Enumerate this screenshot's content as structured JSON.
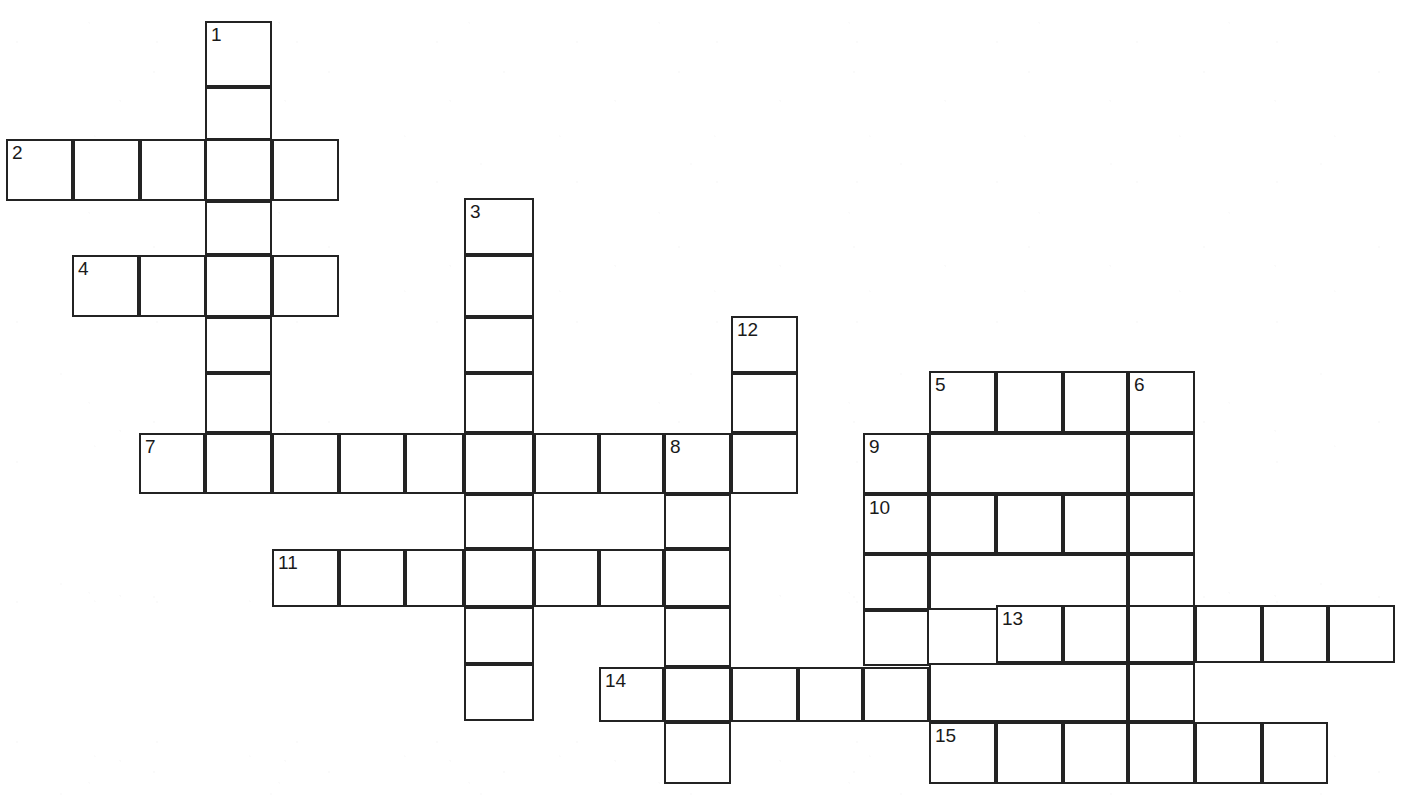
{
  "puzzle": {
    "kind": "crossword-grid",
    "title": "",
    "cell_size": 66.5,
    "border_color": "#232323",
    "cell_fill": "#ffffff",
    "page_background": "#ffffff",
    "number_color": "#1a1a1a",
    "clue_numbers": [
      "1",
      "2",
      "3",
      "4",
      "5",
      "6",
      "7",
      "8",
      "9",
      "10",
      "11",
      "12",
      "13",
      "14",
      "15"
    ],
    "entries": [
      {
        "number": "1",
        "direction": "down",
        "length": 7,
        "start_x": 206,
        "start_y": 22
      },
      {
        "number": "2",
        "direction": "across",
        "length": 5,
        "start_x": 7,
        "start_y": 140
      },
      {
        "number": "3",
        "direction": "down",
        "length": 8,
        "start_x": 465,
        "start_y": 199
      },
      {
        "number": "4",
        "direction": "across",
        "length": 4,
        "start_x": 73,
        "start_y": 256
      },
      {
        "number": "5",
        "direction": "down",
        "length": 6,
        "start_x": 930,
        "start_y": 372
      },
      {
        "number": "6",
        "direction": "down",
        "length": 6,
        "start_x": 1129,
        "start_y": 372
      },
      {
        "number": "7",
        "direction": "across",
        "length": 10,
        "start_x": 140,
        "start_y": 434
      },
      {
        "number": "8",
        "direction": "down",
        "length": 6,
        "start_x": 665,
        "start_y": 434
      },
      {
        "number": "9",
        "direction": "across",
        "length": 5,
        "start_x": 864,
        "start_y": 434
      },
      {
        "number": "9b",
        "direction": "down",
        "length": 6,
        "start_x": 864,
        "start_y": 434
      },
      {
        "number": "10",
        "direction": "across",
        "length": 5,
        "start_x": 864,
        "start_y": 495
      },
      {
        "number": "11",
        "direction": "across",
        "length": 7,
        "start_x": 273,
        "start_y": 550
      },
      {
        "number": "12",
        "direction": "down",
        "length": 3,
        "start_x": 732,
        "start_y": 317
      },
      {
        "number": "13",
        "direction": "across",
        "length": 6,
        "start_x": 997,
        "start_y": 606
      },
      {
        "number": "14",
        "direction": "across",
        "length": 5,
        "start_x": 600,
        "start_y": 668
      },
      {
        "number": "15",
        "direction": "across",
        "length": 6,
        "start_x": 930,
        "start_y": 723
      }
    ],
    "cells": [
      {
        "x": 206,
        "y": 22,
        "w": 67,
        "h": 66,
        "number": "1"
      },
      {
        "x": 206,
        "y": 88,
        "w": 67,
        "h": 53,
        "number": ""
      },
      {
        "x": 7,
        "y": 140,
        "w": 67,
        "h": 62,
        "number": "2"
      },
      {
        "x": 74,
        "y": 140,
        "w": 67,
        "h": 62,
        "number": ""
      },
      {
        "x": 141,
        "y": 140,
        "w": 66,
        "h": 62,
        "number": ""
      },
      {
        "x": 206,
        "y": 140,
        "w": 67,
        "h": 62,
        "number": ""
      },
      {
        "x": 273,
        "y": 140,
        "w": 67,
        "h": 62,
        "number": ""
      },
      {
        "x": 206,
        "y": 202,
        "w": 67,
        "h": 54,
        "number": ""
      },
      {
        "x": 465,
        "y": 199,
        "w": 70,
        "h": 57,
        "number": "3"
      },
      {
        "x": 73,
        "y": 256,
        "w": 67,
        "h": 62,
        "number": "4"
      },
      {
        "x": 140,
        "y": 256,
        "w": 67,
        "h": 62,
        "number": ""
      },
      {
        "x": 206,
        "y": 256,
        "w": 67,
        "h": 62,
        "number": ""
      },
      {
        "x": 273,
        "y": 256,
        "w": 67,
        "h": 62,
        "number": ""
      },
      {
        "x": 465,
        "y": 256,
        "w": 70,
        "h": 62,
        "number": ""
      },
      {
        "x": 206,
        "y": 318,
        "w": 67,
        "h": 56,
        "number": ""
      },
      {
        "x": 465,
        "y": 318,
        "w": 70,
        "h": 56,
        "number": ""
      },
      {
        "x": 732,
        "y": 317,
        "w": 67,
        "h": 57,
        "number": "12"
      },
      {
        "x": 206,
        "y": 374,
        "w": 67,
        "h": 60,
        "number": ""
      },
      {
        "x": 465,
        "y": 374,
        "w": 70,
        "h": 60,
        "number": ""
      },
      {
        "x": 732,
        "y": 374,
        "w": 67,
        "h": 60,
        "number": ""
      },
      {
        "x": 930,
        "y": 372,
        "w": 67,
        "h": 62,
        "number": "5"
      },
      {
        "x": 997,
        "y": 372,
        "w": 67,
        "h": 62,
        "number": ""
      },
      {
        "x": 1064,
        "y": 372,
        "w": 65,
        "h": 62,
        "number": ""
      },
      {
        "x": 1129,
        "y": 372,
        "w": 67,
        "h": 62,
        "number": "6"
      },
      {
        "x": 140,
        "y": 434,
        "w": 66,
        "h": 61,
        "number": "7"
      },
      {
        "x": 206,
        "y": 434,
        "w": 67,
        "h": 61,
        "number": ""
      },
      {
        "x": 273,
        "y": 434,
        "w": 67,
        "h": 61,
        "number": ""
      },
      {
        "x": 340,
        "y": 434,
        "w": 66,
        "h": 61,
        "number": ""
      },
      {
        "x": 406,
        "y": 434,
        "w": 59,
        "h": 61,
        "number": ""
      },
      {
        "x": 465,
        "y": 434,
        "w": 70,
        "h": 61,
        "number": ""
      },
      {
        "x": 535,
        "y": 434,
        "w": 65,
        "h": 61,
        "number": ""
      },
      {
        "x": 600,
        "y": 434,
        "w": 65,
        "h": 61,
        "number": ""
      },
      {
        "x": 665,
        "y": 434,
        "w": 67,
        "h": 61,
        "number": "8"
      },
      {
        "x": 732,
        "y": 434,
        "w": 67,
        "h": 61,
        "number": ""
      },
      {
        "x": 864,
        "y": 434,
        "w": 66,
        "h": 61,
        "number": "9"
      },
      {
        "x": 930,
        "y": 434,
        "w": 199,
        "h": 61,
        "number": ""
      },
      {
        "x": 1129,
        "y": 434,
        "w": 67,
        "h": 61,
        "number": ""
      },
      {
        "x": 864,
        "y": 495,
        "w": 66,
        "h": 60,
        "number": "10"
      },
      {
        "x": 930,
        "y": 495,
        "w": 67,
        "h": 60,
        "number": ""
      },
      {
        "x": 997,
        "y": 495,
        "w": 67,
        "h": 60,
        "number": ""
      },
      {
        "x": 1064,
        "y": 495,
        "w": 65,
        "h": 60,
        "number": ""
      },
      {
        "x": 1129,
        "y": 495,
        "w": 67,
        "h": 60,
        "number": ""
      },
      {
        "x": 465,
        "y": 495,
        "w": 70,
        "h": 55,
        "number": ""
      },
      {
        "x": 665,
        "y": 495,
        "w": 67,
        "h": 55,
        "number": ""
      },
      {
        "x": 273,
        "y": 550,
        "w": 67,
        "h": 58,
        "number": "11"
      },
      {
        "x": 340,
        "y": 550,
        "w": 66,
        "h": 58,
        "number": ""
      },
      {
        "x": 406,
        "y": 550,
        "w": 59,
        "h": 58,
        "number": ""
      },
      {
        "x": 465,
        "y": 550,
        "w": 70,
        "h": 58,
        "number": ""
      },
      {
        "x": 535,
        "y": 550,
        "w": 65,
        "h": 58,
        "number": ""
      },
      {
        "x": 600,
        "y": 550,
        "w": 65,
        "h": 58,
        "number": ""
      },
      {
        "x": 665,
        "y": 550,
        "w": 67,
        "h": 58,
        "number": ""
      },
      {
        "x": 864,
        "y": 555,
        "w": 66,
        "h": 56,
        "number": ""
      },
      {
        "x": 930,
        "y": 555,
        "w": 199,
        "h": 56,
        "number": ""
      },
      {
        "x": 1129,
        "y": 555,
        "w": 67,
        "h": 56,
        "number": ""
      },
      {
        "x": 465,
        "y": 608,
        "w": 70,
        "h": 57,
        "number": ""
      },
      {
        "x": 665,
        "y": 608,
        "w": 67,
        "h": 60,
        "number": ""
      },
      {
        "x": 997,
        "y": 606,
        "w": 67,
        "h": 58,
        "number": "13"
      },
      {
        "x": 1064,
        "y": 606,
        "w": 65,
        "h": 58,
        "number": ""
      },
      {
        "x": 1129,
        "y": 606,
        "w": 67,
        "h": 58,
        "number": ""
      },
      {
        "x": 1196,
        "y": 606,
        "w": 67,
        "h": 58,
        "number": ""
      },
      {
        "x": 1263,
        "y": 606,
        "w": 66,
        "h": 58,
        "number": ""
      },
      {
        "x": 1329,
        "y": 606,
        "w": 67,
        "h": 58,
        "number": ""
      },
      {
        "x": 864,
        "y": 611,
        "w": 66,
        "h": 56,
        "number": ""
      },
      {
        "x": 465,
        "y": 665,
        "w": 70,
        "h": 57,
        "number": ""
      },
      {
        "x": 600,
        "y": 668,
        "w": 65,
        "h": 55,
        "number": "14"
      },
      {
        "x": 665,
        "y": 668,
        "w": 67,
        "h": 55,
        "number": ""
      },
      {
        "x": 732,
        "y": 668,
        "w": 67,
        "h": 55,
        "number": ""
      },
      {
        "x": 799,
        "y": 668,
        "w": 65,
        "h": 55,
        "number": ""
      },
      {
        "x": 864,
        "y": 668,
        "w": 66,
        "h": 55,
        "number": ""
      },
      {
        "x": 930,
        "y": 664,
        "w": 199,
        "h": 59,
        "number": ""
      },
      {
        "x": 1129,
        "y": 664,
        "w": 67,
        "h": 59,
        "number": ""
      },
      {
        "x": 665,
        "y": 723,
        "w": 67,
        "h": 62,
        "number": ""
      },
      {
        "x": 930,
        "y": 723,
        "w": 67,
        "h": 62,
        "number": "15"
      },
      {
        "x": 997,
        "y": 723,
        "w": 67,
        "h": 62,
        "number": ""
      },
      {
        "x": 1064,
        "y": 723,
        "w": 65,
        "h": 62,
        "number": ""
      },
      {
        "x": 1129,
        "y": 723,
        "w": 67,
        "h": 62,
        "number": ""
      },
      {
        "x": 1196,
        "y": 723,
        "w": 67,
        "h": 62,
        "number": ""
      },
      {
        "x": 1263,
        "y": 723,
        "w": 66,
        "h": 62,
        "number": ""
      }
    ]
  }
}
